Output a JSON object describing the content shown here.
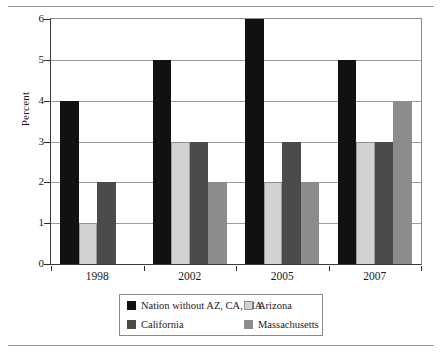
{
  "chart_data": {
    "type": "bar",
    "title": "",
    "subtitle": "",
    "xlabel": "",
    "ylabel": "Percent",
    "categories": [
      "1998",
      "2002",
      "2005",
      "2007"
    ],
    "ylim": [
      0,
      6
    ],
    "ytick_labels": [
      "0",
      "1",
      "2",
      "3",
      "4",
      "5",
      "6"
    ],
    "ytick_values": [
      0,
      1,
      2,
      3,
      4,
      5,
      6
    ],
    "grid": true,
    "legend_position": "bottom",
    "series": [
      {
        "name": "Nation without AZ, CA, MA",
        "color": "#111111",
        "values": [
          4,
          5,
          6,
          5
        ]
      },
      {
        "name": "Arizona",
        "color": "#d2d2d2",
        "values": [
          1,
          3,
          2,
          3
        ]
      },
      {
        "name": "California",
        "color": "#4b4b4b",
        "values": [
          2,
          3,
          3,
          3
        ]
      },
      {
        "name": "Massachusetts",
        "color": "#8c8c8c",
        "values": [
          0,
          2,
          2,
          4
        ]
      }
    ],
    "annotations": []
  },
  "legend": {
    "entries": [
      {
        "label": "Nation without AZ, CA, MA"
      },
      {
        "label": "Arizona"
      },
      {
        "label": "California"
      },
      {
        "label": "Massachusetts"
      }
    ]
  }
}
